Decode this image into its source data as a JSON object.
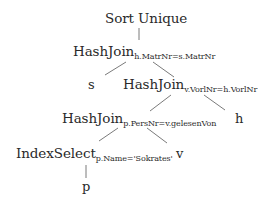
{
  "diagram": {
    "type": "query-evaluation-plan-tree",
    "root": {
      "operator": "Sort Unique",
      "children": [
        {
          "operator": "HashJoin",
          "condition": "h.MatrNr=s.MatrNr",
          "children": [
            {
              "relation": "s"
            },
            {
              "operator": "HashJoin",
              "condition": "v.VorlNr=h.VorlNr",
              "children": [
                {
                  "operator": "HashJoin",
                  "condition": "p.PersNr=v.gelesenVon",
                  "children": [
                    {
                      "operator": "IndexSelect",
                      "condition": "p.Name='Sokrates'",
                      "children": [
                        {
                          "relation": "p"
                        }
                      ]
                    },
                    {
                      "relation": "v"
                    }
                  ]
                },
                {
                  "relation": "h"
                }
              ]
            }
          ]
        }
      ]
    }
  },
  "nodes": {
    "sort_unique": {
      "label": "Sort Unique"
    },
    "hashjoin_1": {
      "label": "HashJoin",
      "subscript": "h.MatrNr=s.MatrNr"
    },
    "leaf_s": {
      "label": "s"
    },
    "hashjoin_2": {
      "label": "HashJoin",
      "subscript": "v.VorlNr=h.VorlNr"
    },
    "hashjoin_3": {
      "label": "HashJoin",
      "subscript": "p.PersNr=v.gelesenVon"
    },
    "leaf_h": {
      "label": "h"
    },
    "indexselect": {
      "label": "IndexSelect",
      "subscript": "p.Name='Sokrates'"
    },
    "leaf_v": {
      "label": "v"
    },
    "leaf_p": {
      "label": "p"
    }
  },
  "colors": {
    "text": "#2a2a2a",
    "edges": "#6b6b6b",
    "background": "#ffffff"
  }
}
